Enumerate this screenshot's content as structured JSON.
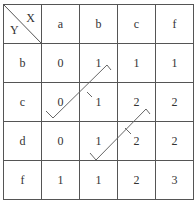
{
  "table": {
    "corner": {
      "col_label": "X",
      "row_label": "Y"
    },
    "columns": [
      "a",
      "b",
      "c",
      "f"
    ],
    "rows": [
      {
        "label": "b",
        "cells": [
          "0",
          "1",
          "1",
          "1"
        ]
      },
      {
        "label": "c",
        "cells": [
          "0",
          "1",
          "2",
          "2"
        ]
      },
      {
        "label": "d",
        "cells": [
          "0",
          "1",
          "2",
          "2"
        ]
      },
      {
        "label": "f",
        "cells": [
          "1",
          "1",
          "2",
          "3"
        ]
      }
    ]
  },
  "annotations": {
    "arrows": [
      {
        "from": "row c, col a",
        "to": "row b, col b",
        "tick_at": "row c, col b"
      },
      {
        "from": "row d, col b",
        "to": "row c, col c",
        "tick_at": "row d, col c"
      }
    ]
  }
}
